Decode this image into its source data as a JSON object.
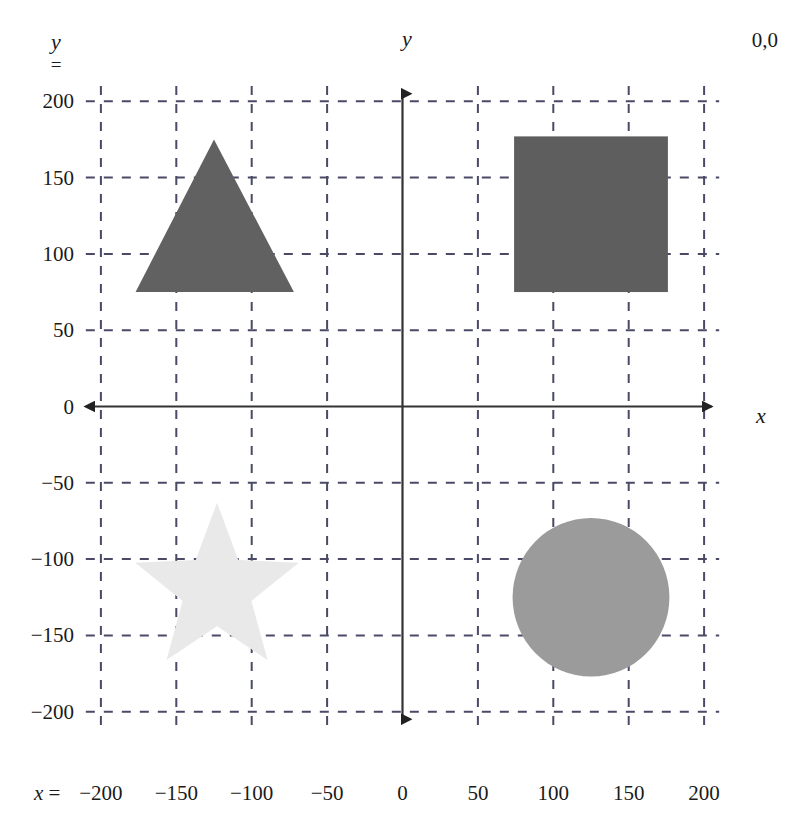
{
  "figure": {
    "origin_label": "0,0",
    "x_axis": {
      "name": "x",
      "prefix_label": "x =",
      "ticks": [
        "-200",
        "-150",
        "-100",
        "-50",
        "0",
        "50",
        "100",
        "150",
        "200"
      ],
      "tick_values": [
        -200,
        -150,
        -100,
        -50,
        0,
        50,
        100,
        150,
        200
      ],
      "range": [
        -210,
        210
      ]
    },
    "y_axis": {
      "name": "y",
      "prefix_var": "y",
      "prefix_eq": "=",
      "ticks": [
        "200",
        "150",
        "100",
        "50",
        "0",
        "-50",
        "-100",
        "-150",
        "-200"
      ],
      "tick_values": [
        200,
        150,
        100,
        50,
        0,
        -50,
        -100,
        -150,
        -200
      ],
      "range": [
        -210,
        210
      ]
    },
    "grid": {
      "enabled": true,
      "style": "dashed",
      "color": "#4a4a66",
      "spacing": 50
    },
    "axis_color": "#333333"
  },
  "chart_data": {
    "type": "scatter",
    "xlabel": "x",
    "ylabel": "y",
    "xlim": [
      -210,
      210
    ],
    "ylim": [
      -210,
      210
    ],
    "grid": true,
    "legend": "none",
    "annotations": [
      "0,0"
    ],
    "shapes": [
      {
        "name": "triangle",
        "kind": "triangle",
        "color": "#616161",
        "apex": [
          -125,
          175
        ],
        "base_left": [
          -177,
          75
        ],
        "base_right": [
          -72,
          75
        ],
        "center": [
          -125,
          108
        ],
        "width": 105,
        "height": 100
      },
      {
        "name": "square",
        "kind": "square",
        "color": "#5e5e5e",
        "x_min": 74,
        "x_max": 176,
        "y_min": 75,
        "y_max": 177,
        "center": [
          125,
          126
        ],
        "width": 102,
        "height": 102
      },
      {
        "name": "star",
        "kind": "star",
        "color": "#e9e9e9",
        "center": [
          -123,
          -120
        ],
        "outer_radius": 57,
        "inner_radius": 24,
        "points": 5
      },
      {
        "name": "circle",
        "kind": "circle",
        "color": "#9b9b9b",
        "center": [
          125,
          -125
        ],
        "radius": 52
      }
    ]
  },
  "colors": {
    "triangle": "#616161",
    "square": "#5e5e5e",
    "circle": "#9b9b9b",
    "star": "#e9e9e9",
    "grid": "#4a4a66",
    "axis": "#333333",
    "text": "#1a1a1a",
    "background": "#ffffff"
  }
}
